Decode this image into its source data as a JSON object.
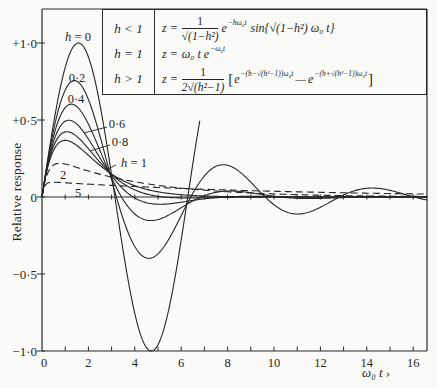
{
  "axes": {
    "ylabel": "Relative response",
    "xlabel": "ω₀ t",
    "xlabel_arrow": " ›"
  },
  "legend": {
    "rows": [
      {
        "condition": "h < 1",
        "lhs": "z =",
        "frac_num": "1",
        "frac_den": "√(1−h²)",
        "base": "e",
        "exponent": "−hω₀t",
        "tail": "sin{√(1−h²) ω₀ t}"
      },
      {
        "condition": "h = 1",
        "lhs": "z =",
        "expr": "ω₀ t e",
        "exponent": "−ω₀t"
      },
      {
        "condition": "h > 1",
        "lhs": "z =",
        "frac_num": "1",
        "frac_den": "2√(h²−1)",
        "bracket_open": "[",
        "base1": "e",
        "exp1": "−(h−√(h²−1))ω₀t",
        "minus": "—",
        "base2": "e",
        "exp2": "−(h+√(h²−1))ω₀t",
        "bracket_close": "]"
      }
    ]
  },
  "chart_data": {
    "type": "line",
    "title": "",
    "xlabel": "ω₀ t",
    "ylabel": "Relative response",
    "xlim": [
      0,
      16.6
    ],
    "ylim": [
      -1.0,
      1.22
    ],
    "grid": false,
    "x_ticks": [
      0,
      2,
      4,
      6,
      8,
      10,
      12,
      14,
      16
    ],
    "x_minor_ticks": [
      1,
      2,
      3,
      4,
      5,
      6,
      7,
      8,
      9,
      10,
      11,
      12,
      13,
      14,
      15,
      16
    ],
    "y_ticks": [
      {
        "value": 1.0,
        "label": "+1·0"
      },
      {
        "value": 0.5,
        "label": "+0·5"
      },
      {
        "value": 0.0,
        "label": "0"
      },
      {
        "value": -0.5,
        "label": "−0·5"
      },
      {
        "value": -1.0,
        "label": "−1·0"
      }
    ],
    "series": [
      {
        "name": "h = 0",
        "h": 0,
        "style": "solid",
        "t_max": 6.8,
        "label_var": "h",
        "label_text": " = 0",
        "x": [
          0,
          1,
          2,
          3,
          4,
          5,
          6,
          6.8
        ],
        "values": [
          0,
          0.841,
          0.909,
          0.141,
          -0.757,
          -0.959,
          -0.279,
          0.494
        ]
      },
      {
        "name": "h = 0.2",
        "h": 0.2,
        "style": "solid",
        "t_max": 16.6,
        "label_var": "",
        "label_text": "0·2",
        "x": [
          0,
          1,
          2,
          3,
          4,
          5,
          6,
          7,
          8,
          9,
          10,
          11,
          12,
          13,
          14,
          15,
          16
        ],
        "values": [
          0,
          0.694,
          0.633,
          0.112,
          -0.322,
          -0.369,
          -0.121,
          0.137,
          0.206,
          0.096,
          -0.05,
          -0.11,
          -0.067,
          0.013,
          0.057,
          0.043,
          0.001
        ]
      },
      {
        "name": "h = 0.4",
        "h": 0.4,
        "style": "solid",
        "t_max": 16.6,
        "label_var": "",
        "label_text": "0·4",
        "x": [
          0,
          1,
          2,
          3,
          4,
          5,
          6,
          7,
          8,
          9,
          10,
          11,
          12,
          13,
          14,
          15,
          16
        ],
        "values": [
          0,
          0.581,
          0.474,
          0.126,
          -0.11,
          -0.146,
          -0.07,
          0.009,
          0.039,
          0.028,
          0.005,
          -0.008,
          -0.009,
          -0.004,
          0.001,
          0.003,
          0.002
        ]
      },
      {
        "name": "h = 0.6",
        "h": 0.6,
        "style": "solid",
        "t_max": 16.6,
        "label_var": "",
        "label_text": "0·6",
        "x": [
          0,
          1,
          2,
          3,
          4,
          5,
          6,
          7,
          8,
          9,
          10,
          11,
          12,
          13,
          14,
          15,
          16
        ],
        "values": [
          0,
          0.492,
          0.376,
          0.14,
          -0.007,
          -0.047,
          -0.034,
          -0.012,
          0.001,
          0.005,
          0.003,
          0.001,
          0.0,
          0,
          0,
          0,
          0
        ]
      },
      {
        "name": "h = 0.8",
        "h": 0.8,
        "style": "solid",
        "t_max": 16.6,
        "label_var": "",
        "label_text": "0·8",
        "x": [
          0,
          1,
          2,
          3,
          4,
          5,
          6,
          7,
          8,
          9,
          10,
          11,
          12,
          13,
          14,
          15,
          16
        ],
        "values": [
          0,
          0.423,
          0.314,
          0.147,
          0.046,
          0.004,
          -0.006,
          -0.005,
          -0.003,
          -0.001,
          0,
          0,
          0,
          0,
          0,
          0,
          0
        ]
      },
      {
        "name": "h = 1",
        "h": 1,
        "style": "solid",
        "t_max": 16.6,
        "label_var": "h",
        "label_text": " = 1",
        "x": [
          0,
          1,
          2,
          3,
          4,
          5,
          6,
          7,
          8,
          9,
          10,
          11,
          12,
          13,
          14,
          15,
          16
        ],
        "values": [
          0,
          0.368,
          0.271,
          0.149,
          0.073,
          0.034,
          0.015,
          0.006,
          0.003,
          0.001,
          0.0,
          0,
          0,
          0,
          0,
          0,
          0
        ]
      },
      {
        "name": "h = 2",
        "h": 2,
        "style": "dashed",
        "t_max": 16.6,
        "label_var": "",
        "label_text": "2",
        "x": [
          0,
          1,
          2,
          3,
          4,
          5,
          6,
          7,
          8,
          9,
          10,
          11,
          12,
          13,
          14,
          15,
          16
        ],
        "values": [
          0,
          0.214,
          0.169,
          0.129,
          0.099,
          0.076,
          0.058,
          0.044,
          0.034,
          0.026,
          0.02,
          0.015,
          0.012,
          0.009,
          0.007,
          0.005,
          0.004
        ]
      },
      {
        "name": "h = 5",
        "h": 5,
        "style": "dashed",
        "t_max": 16.6,
        "label_var": "",
        "label_text": "5",
        "x": [
          0,
          1,
          2,
          3,
          4,
          5,
          6,
          7,
          8,
          9,
          10,
          11,
          12,
          13,
          14,
          15,
          16
        ],
        "values": [
          0,
          0.092,
          0.083,
          0.075,
          0.068,
          0.062,
          0.056,
          0.05,
          0.046,
          0.041,
          0.037,
          0.034,
          0.03,
          0.028,
          0.025,
          0.022,
          0.02
        ]
      }
    ]
  }
}
